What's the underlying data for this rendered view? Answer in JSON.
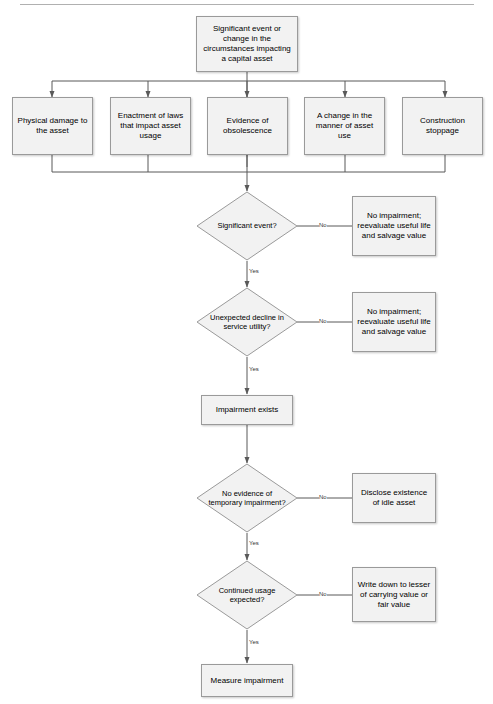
{
  "document": {
    "title": "Asset Impairment Decision Flowchart",
    "divider": "horizontal-rule"
  },
  "colors": {
    "node_fill": "#f2f2f2",
    "node_border": "#9a9a9a",
    "connector": "#595959",
    "label_text": "#333333",
    "text": "#000000",
    "background": "#ffffff"
  },
  "flowchart": {
    "start": {
      "id": "significant-event-trigger",
      "label": "Significant event or change in the circumstances impacting a capital asset",
      "shape": "rectangle"
    },
    "triggers": [
      {
        "id": "physical-damage",
        "label": "Physical damage to the asset",
        "shape": "rectangle"
      },
      {
        "id": "enactment-of-laws",
        "label": "Enactment of laws that impact asset usage",
        "shape": "rectangle"
      },
      {
        "id": "evidence-of-obsolescence",
        "label": "Evidence of obsolescence",
        "shape": "rectangle"
      },
      {
        "id": "change-in-manner-of-use",
        "label": "A change in the manner of asset use",
        "shape": "rectangle"
      },
      {
        "id": "construction-stoppage",
        "label": "Construction stoppage",
        "shape": "rectangle"
      }
    ],
    "decisions": [
      {
        "id": "significant-event",
        "label": "Significant event?",
        "shape": "diamond",
        "yes_label": "Yes",
        "no_label": "No",
        "no_target": "No impairment; reevaluate useful life and salvage value"
      },
      {
        "id": "unexpected-decline",
        "label": "Unexpected decline in service utility?",
        "shape": "diamond",
        "yes_label": "Yes",
        "no_label": "No",
        "no_target": "No impairment; reevaluate useful life and salvage value"
      },
      {
        "id": "no-evidence-temporary",
        "label": "No evidence of temporary impairment?",
        "shape": "diamond",
        "yes_label": "Yes",
        "no_label": "No",
        "no_target": "Disclose existence of idle asset"
      },
      {
        "id": "continued-usage",
        "label": "Continued usage expected?",
        "shape": "diamond",
        "yes_label": "Yes",
        "no_label": "No",
        "no_target": "Write down to lesser of carrying value or fair value"
      }
    ],
    "outcomes": [
      {
        "id": "no-impairment-1",
        "label": "No impairment; reevaluate useful life and salvage value",
        "shape": "rectangle"
      },
      {
        "id": "no-impairment-2",
        "label": "No impairment; reevaluate useful life and salvage value",
        "shape": "rectangle"
      },
      {
        "id": "disclose-idle-asset",
        "label": "Disclose existence of idle asset",
        "shape": "rectangle"
      },
      {
        "id": "write-down",
        "label": "Write down to lesser of carrying value or fair value",
        "shape": "rectangle"
      }
    ],
    "process": [
      {
        "id": "impairment-exists",
        "label": "Impairment exists",
        "shape": "rectangle"
      },
      {
        "id": "measure-impairment",
        "label": "Measure impairment",
        "shape": "rectangle"
      }
    ]
  }
}
